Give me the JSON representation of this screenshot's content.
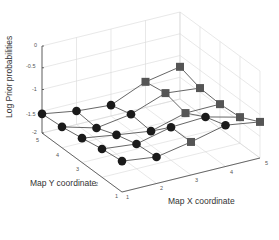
{
  "chart_data": {
    "type": "surface-mesh-3d",
    "title": "",
    "xlabel": "Map X coordinate",
    "ylabel": "Map Y coordinate",
    "zlabel": "Log Prior probabilities",
    "x": [
      1,
      2,
      3,
      4,
      5
    ],
    "y": [
      1,
      2,
      3,
      4,
      5
    ],
    "xticks": [
      "1",
      "2",
      "3",
      "4",
      "5"
    ],
    "yticks": [
      "1",
      "2",
      "3",
      "4",
      "5"
    ],
    "zticks": [
      "-2",
      "-1.5",
      "-1",
      "-0.5",
      "0"
    ],
    "xlim": [
      1,
      5
    ],
    "ylim": [
      1,
      5
    ],
    "zlim": [
      -2,
      0
    ],
    "grid": true,
    "z_by_y_row": {
      "y1": [
        -1.29,
        -1.39,
        -1.24,
        -1.05,
        -1.17
      ],
      "y2": [
        -1.35,
        -1.43,
        -1.24,
        -1.2,
        -1.4
      ],
      "y3": [
        -1.44,
        -1.56,
        -1.67,
        -1.45,
        -1.44
      ],
      "y4": [
        -1.52,
        -1.74,
        -1.62,
        -1.33,
        -1.41
      ],
      "y5": [
        -1.56,
        -1.69,
        -1.75,
        -1.41,
        -1.26
      ]
    },
    "marker_by_y_row": {
      "y1": [
        "circle",
        "circle",
        "square",
        "circle",
        "square"
      ],
      "y2": [
        "circle",
        "circle",
        "circle",
        "circle",
        "square"
      ],
      "y3": [
        "circle",
        "circle",
        "circle",
        "square",
        "square"
      ],
      "y4": [
        "circle",
        "circle",
        "circle",
        "square",
        "square"
      ],
      "y5": [
        "circle",
        "circle",
        "circle",
        "square",
        "square"
      ]
    },
    "colors": {
      "circle_marker": "#1a1a1a",
      "square_marker": "#555555",
      "mesh_line": "#555555",
      "grid": "#d8d8d8",
      "axis": "#444444"
    }
  }
}
